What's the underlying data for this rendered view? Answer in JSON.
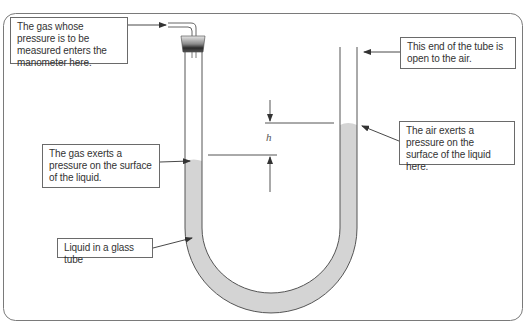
{
  "diagram": {
    "labels": {
      "gas_inlet": "The gas whose pressure is to be measured enters the manometer here.",
      "open_end": "This end of the tube is open to the air.",
      "gas_pressure": "The gas exerts a pressure on the surface of the liquid.",
      "air_pressure": "The air exerts a pressure on the surface of the liquid here.",
      "liquid": "Liquid in a glass tube",
      "height_symbol": "h"
    },
    "colors": {
      "frame": "#7a7a7a",
      "tube_outline": "#555555",
      "liquid_fill": "#d4d4d4",
      "label_border": "#6a6a6a",
      "text": "#333333",
      "stopper_top": "#e0e0e0",
      "stopper_bottom": "#2a2a2a"
    },
    "levels": {
      "left_liquid_surface_y": 161,
      "right_liquid_surface_y": 125
    }
  }
}
